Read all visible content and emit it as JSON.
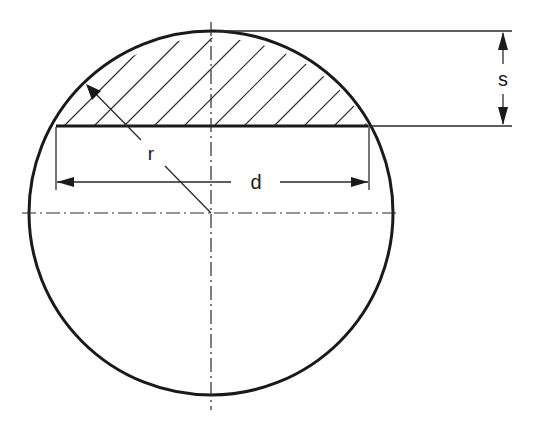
{
  "figure": {
    "labels": {
      "radius": "r",
      "chord_length": "d",
      "segment_height": "s"
    },
    "circle": {
      "cx": 211,
      "cy": 213,
      "r": 182
    },
    "chord": {
      "y": 126,
      "x1": 56,
      "x2": 368
    },
    "hatched_region": "circular segment above chord",
    "colors": {
      "ink": "#1a1a1a",
      "background": "#ffffff"
    }
  }
}
